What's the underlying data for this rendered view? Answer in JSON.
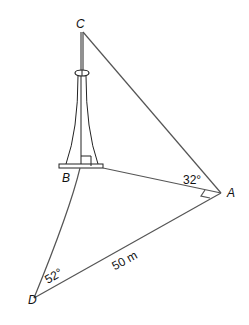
{
  "diagram": {
    "type": "3d-trigonometry-figure",
    "points": {
      "C": {
        "label": "C",
        "x": 82,
        "y": 32
      },
      "B": {
        "label": "B",
        "x": 80,
        "y": 166
      },
      "A": {
        "label": "A",
        "x": 221,
        "y": 193
      },
      "D": {
        "label": "D",
        "x": 34,
        "y": 298
      }
    },
    "angles": {
      "at_A": {
        "label": "32°",
        "between": "BA and CA"
      },
      "at_D": {
        "label": "52°",
        "between": "DB and DA"
      }
    },
    "right_angles": [
      "at B (CB ⟂ BA)",
      "at A (DA ⟂ BA)"
    ],
    "lengths": {
      "DA": {
        "label": "50 m"
      }
    },
    "edges": [
      "CA",
      "BA",
      "DA",
      "DB",
      "CB"
    ],
    "colors": {
      "lines": "#555555",
      "tower": "#222222",
      "text": "#111111"
    }
  }
}
